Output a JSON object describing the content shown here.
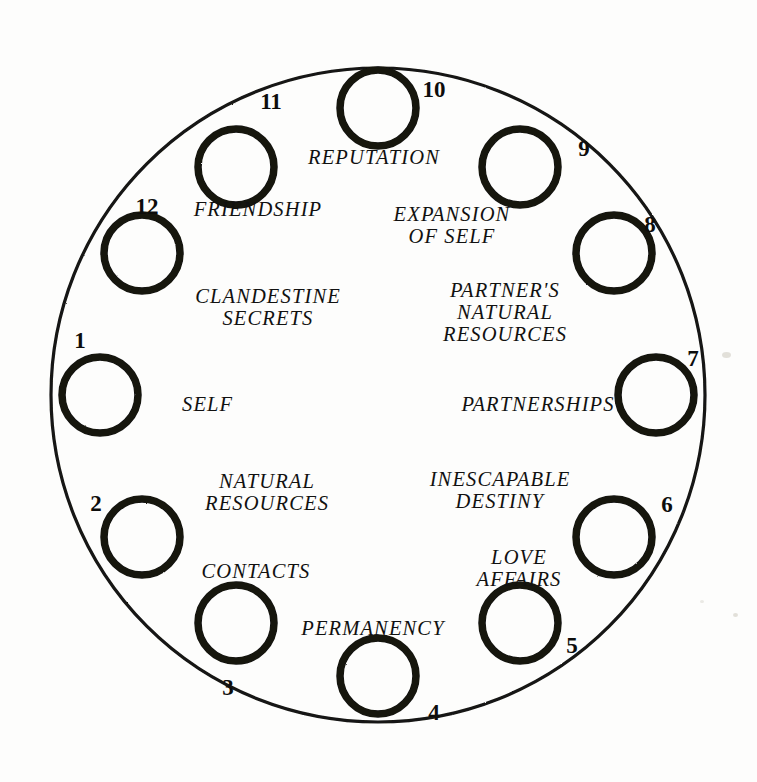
{
  "diagram": {
    "background_color": "#fdfdfc",
    "ink_color": "#111110",
    "outer_circle": {
      "cx": 378,
      "cy": 395,
      "r": 327,
      "stroke_width": 3.2
    },
    "orbit": {
      "radius": 284,
      "node_radius": 38,
      "node_stroke_width": 7.5
    }
  },
  "houses": [
    {
      "number": "1",
      "label": "SELF",
      "node": {
        "cx": 100,
        "cy": 395
      },
      "number_pos": {
        "x": 80,
        "y": 340
      },
      "label_pos": {
        "x": 182,
        "y": 404
      },
      "align": "left"
    },
    {
      "number": "2",
      "label": "NATURAL\nRESOURCES",
      "node": {
        "cx": 142,
        "cy": 537
      },
      "number_pos": {
        "x": 96,
        "y": 503
      },
      "label_pos": {
        "x": 267,
        "y": 492
      },
      "align": "center"
    },
    {
      "number": "3",
      "label": "CONTACTS",
      "node": {
        "cx": 236,
        "cy": 623
      },
      "number_pos": {
        "x": 228,
        "y": 687
      },
      "label_pos": {
        "x": 256,
        "y": 571
      },
      "align": "center"
    },
    {
      "number": "4",
      "label": "PERMANENCY",
      "node": {
        "cx": 378,
        "cy": 676
      },
      "number_pos": {
        "x": 434,
        "y": 712
      },
      "label_pos": {
        "x": 373,
        "y": 628
      },
      "align": "center"
    },
    {
      "number": "5",
      "label": "LOVE\nAFFAIRS",
      "node": {
        "cx": 520,
        "cy": 623
      },
      "number_pos": {
        "x": 572,
        "y": 645
      },
      "label_pos": {
        "x": 519,
        "y": 568
      },
      "align": "center"
    },
    {
      "number": "6",
      "label": "INESCAPABLE\nDESTINY",
      "node": {
        "cx": 614,
        "cy": 537
      },
      "number_pos": {
        "x": 667,
        "y": 504
      },
      "label_pos": {
        "x": 500,
        "y": 490
      },
      "align": "center"
    },
    {
      "number": "7",
      "label": "PARTNERSHIPS",
      "node": {
        "cx": 656,
        "cy": 395
      },
      "number_pos": {
        "x": 693,
        "y": 358
      },
      "label_pos": {
        "x": 538,
        "y": 404
      },
      "align": "center"
    },
    {
      "number": "8",
      "label": "PARTNER'S\nNATURAL\nRESOURCES",
      "node": {
        "cx": 614,
        "cy": 253
      },
      "number_pos": {
        "x": 650,
        "y": 224
      },
      "label_pos": {
        "x": 505,
        "y": 312
      },
      "align": "center"
    },
    {
      "number": "9",
      "label": "EXPANSION\nOF SELF",
      "node": {
        "cx": 520,
        "cy": 167
      },
      "number_pos": {
        "x": 584,
        "y": 148
      },
      "label_pos": {
        "x": 452,
        "y": 225
      },
      "align": "center"
    },
    {
      "number": "10",
      "label": "REPUTATION",
      "node": {
        "cx": 378,
        "cy": 108
      },
      "number_pos": {
        "x": 434,
        "y": 89
      },
      "label_pos": {
        "x": 374,
        "y": 157
      },
      "align": "center"
    },
    {
      "number": "11",
      "label": "FRIENDSHIP",
      "node": {
        "cx": 236,
        "cy": 167
      },
      "number_pos": {
        "x": 271,
        "y": 101
      },
      "label_pos": {
        "x": 258,
        "y": 209
      },
      "align": "center"
    },
    {
      "number": "12",
      "label": "CLANDESTINE\nSECRETS",
      "node": {
        "cx": 142,
        "cy": 253
      },
      "number_pos": {
        "x": 147,
        "y": 206
      },
      "label_pos": {
        "x": 268,
        "y": 307
      },
      "align": "center"
    }
  ]
}
